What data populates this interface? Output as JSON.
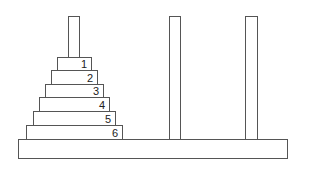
{
  "base": {
    "x": 18,
    "y": 139,
    "w": 270,
    "h": 20
  },
  "pegs": [
    {
      "name": "peg-1",
      "x": 68,
      "y": 16,
      "w": 12,
      "h": 42
    },
    {
      "name": "peg-2",
      "x": 169,
      "y": 16,
      "w": 12,
      "h": 124
    },
    {
      "name": "peg-3",
      "x": 245,
      "y": 16,
      "w": 13,
      "h": 124
    }
  ],
  "disks": [
    {
      "label": "1",
      "x": 57,
      "y": 57,
      "w": 35,
      "h": 14
    },
    {
      "label": "2",
      "x": 51,
      "y": 70,
      "w": 47,
      "h": 15
    },
    {
      "label": "3",
      "x": 45,
      "y": 84,
      "w": 59,
      "h": 14
    },
    {
      "label": "4",
      "x": 39,
      "y": 97,
      "w": 71,
      "h": 15
    },
    {
      "label": "5",
      "x": 33,
      "y": 111,
      "w": 83,
      "h": 15
    },
    {
      "label": "6",
      "x": 26,
      "y": 125,
      "w": 97,
      "h": 15
    }
  ],
  "colors": {
    "stroke": "#555555",
    "fill": "#ffffff",
    "text": "#222222"
  }
}
